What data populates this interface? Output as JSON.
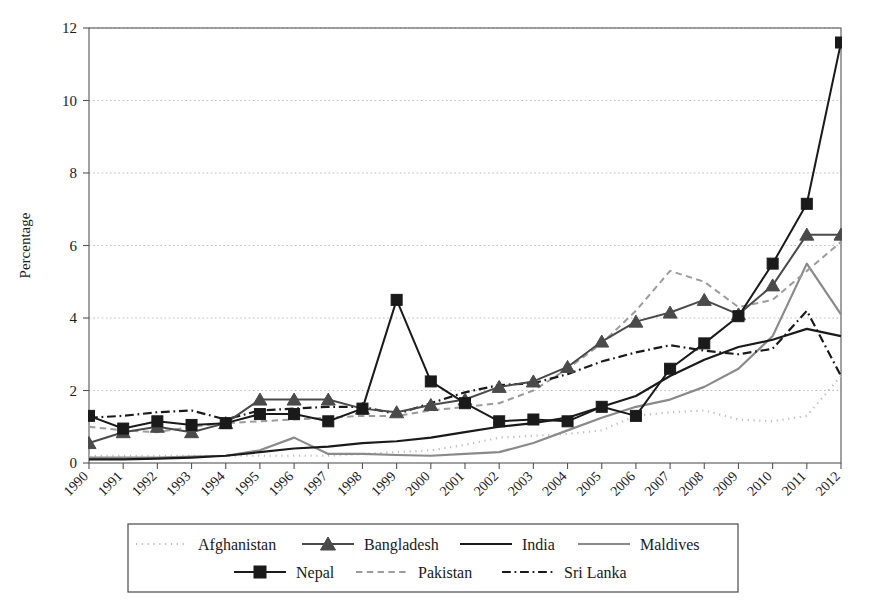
{
  "chart_data": {
    "type": "line",
    "title": "",
    "xlabel": "",
    "ylabel": "Percentage",
    "xlim": [
      1990,
      2012
    ],
    "ylim": [
      0,
      12
    ],
    "ytick_values": [
      0,
      2,
      4,
      6,
      8,
      10,
      12
    ],
    "grid": true,
    "legend_position": "bottom",
    "x": [
      1990,
      1991,
      1992,
      1993,
      1994,
      1995,
      1996,
      1997,
      1998,
      1999,
      2000,
      2001,
      2002,
      2003,
      2004,
      2005,
      2006,
      2007,
      2008,
      2009,
      2010,
      2011,
      2012
    ],
    "categories": [
      "1990",
      "1991",
      "1992",
      "1993",
      "1994",
      "1995",
      "1996",
      "1997",
      "1998",
      "1999",
      "2000",
      "2001",
      "2002",
      "2003",
      "2004",
      "2005",
      "2006",
      "2007",
      "2008",
      "2009",
      "2010",
      "2011",
      "2012"
    ],
    "series": [
      {
        "name": "Afghanistan",
        "color": "#bdbdbd",
        "style": "dotted",
        "marker": "none",
        "width": 2.2,
        "values": [
          0.2,
          0.2,
          0.2,
          0.2,
          0.2,
          0.2,
          0.2,
          0.2,
          0.25,
          0.3,
          0.35,
          0.5,
          0.7,
          0.75,
          0.8,
          0.9,
          1.3,
          1.4,
          1.45,
          1.2,
          1.15,
          1.3,
          2.4
        ]
      },
      {
        "name": "Bangladesh",
        "color": "#4a4a4a",
        "style": "solid",
        "marker": "triangle",
        "width": 2.0,
        "values": [
          0.55,
          0.85,
          1.0,
          0.85,
          1.1,
          1.75,
          1.75,
          1.75,
          1.5,
          1.4,
          1.6,
          1.75,
          2.1,
          2.25,
          2.65,
          3.35,
          3.9,
          4.15,
          4.5,
          4.1,
          4.9,
          6.3,
          6.3
        ]
      },
      {
        "name": "India",
        "color": "#1a1a1a",
        "style": "solid",
        "marker": "none",
        "width": 2.2,
        "values": [
          0.1,
          0.1,
          0.12,
          0.15,
          0.2,
          0.3,
          0.4,
          0.45,
          0.55,
          0.6,
          0.7,
          0.85,
          1.0,
          1.1,
          1.25,
          1.55,
          1.85,
          2.4,
          2.85,
          3.2,
          3.4,
          3.7,
          3.5
        ]
      },
      {
        "name": "Maldives",
        "color": "#8a8a8a",
        "style": "solid",
        "marker": "none",
        "width": 2.2,
        "values": [
          0.15,
          0.15,
          0.15,
          0.18,
          0.2,
          0.35,
          0.7,
          0.25,
          0.25,
          0.22,
          0.2,
          0.25,
          0.3,
          0.55,
          0.9,
          1.25,
          1.55,
          1.75,
          2.1,
          2.6,
          3.5,
          5.5,
          4.1
        ]
      },
      {
        "name": "Nepal",
        "color": "#1a1a1a",
        "style": "solid",
        "marker": "square",
        "width": 2.0,
        "values": [
          1.3,
          0.95,
          1.15,
          1.05,
          1.1,
          1.35,
          1.35,
          1.15,
          1.5,
          4.5,
          2.25,
          1.65,
          1.15,
          1.2,
          1.15,
          1.55,
          1.3,
          2.6,
          3.3,
          4.05,
          5.5,
          7.15,
          11.6
        ]
      },
      {
        "name": "Pakistan",
        "color": "#9c9c9c",
        "style": "dashed",
        "marker": "none",
        "width": 2.0,
        "values": [
          1.0,
          0.9,
          0.85,
          1.0,
          1.1,
          1.15,
          1.2,
          1.25,
          1.3,
          1.3,
          1.45,
          1.55,
          1.65,
          2.0,
          2.6,
          3.3,
          4.2,
          5.3,
          5.0,
          4.3,
          4.5,
          5.3,
          6.1
        ]
      },
      {
        "name": "Sri Lanka",
        "color": "#1a1a1a",
        "style": "dashdot",
        "marker": "none",
        "width": 2.2,
        "values": [
          1.25,
          1.3,
          1.4,
          1.45,
          1.2,
          1.45,
          1.5,
          1.55,
          1.55,
          1.35,
          1.65,
          1.95,
          2.15,
          2.2,
          2.45,
          2.8,
          3.05,
          3.25,
          3.1,
          3.0,
          3.15,
          4.2,
          2.4
        ]
      }
    ]
  },
  "axes": {
    "ylabel": "Percentage",
    "yticks": [
      "0",
      "2",
      "4",
      "6",
      "8",
      "10",
      "12"
    ],
    "xticks": [
      "1990",
      "1991",
      "1992",
      "1993",
      "1994",
      "1995",
      "1996",
      "1997",
      "1998",
      "1999",
      "2000",
      "2001",
      "2002",
      "2003",
      "2004",
      "2005",
      "2006",
      "2007",
      "2008",
      "2009",
      "2010",
      "2011",
      "2012"
    ]
  },
  "legend": {
    "row1": [
      "Afghanistan",
      "Bangladesh",
      "India",
      "Maldives"
    ],
    "row2": [
      "Nepal",
      "Pakistan",
      "Sri Lanka"
    ]
  },
  "colors": {
    "afghanistan": "#bdbdbd",
    "bangladesh": "#4a4a4a",
    "india": "#1a1a1a",
    "maldives": "#8a8a8a",
    "nepal": "#1a1a1a",
    "pakistan": "#9c9c9c",
    "sri_lanka": "#1a1a1a",
    "axis": "#555555",
    "grid": "#b9b9b9"
  }
}
